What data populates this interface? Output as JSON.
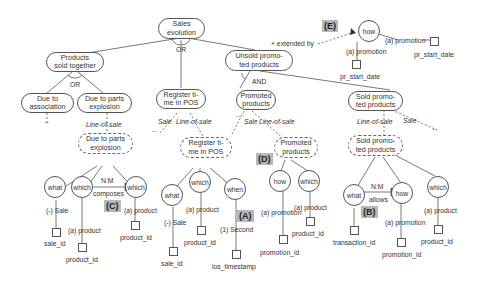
{
  "diagram": {
    "root": {
      "label_1": "Sales",
      "label_2": "evolution"
    },
    "root_decomposition": "OR",
    "goals": {
      "products_sold_together": {
        "label_1": "Products",
        "label_2": "sold together",
        "decomposition": "OR"
      },
      "due_to_association": {
        "label_1": "Due to",
        "label_2": "association"
      },
      "due_to_parts_explosion": {
        "label_1": "Due to parts",
        "label_2": "explosion"
      },
      "register_time_in_pos": {
        "label_1": "Register ti-",
        "label_2": "me in POS"
      },
      "unsold_promoted_products": {
        "label_1": "Unsold promo-",
        "label_2": "ted products",
        "decomposition": "AND"
      },
      "promoted_products": {
        "label_1": "Promoted",
        "label_2": "products"
      },
      "sold_promoted_products": {
        "label_1": "Sold promo-",
        "label_2": "ted products"
      }
    },
    "contexts": {
      "due_to_parts_explosion": {
        "label_1": "Due to parts",
        "label_2": "explosion"
      },
      "register_time_in_pos": {
        "label_1": "Register ti-",
        "label_2": "me in POS"
      },
      "promoted_products": {
        "label_1": "Promoted",
        "label_2": "products"
      },
      "sold_promoted_products": {
        "label_1": "Sold promo-",
        "label_2": "ted products"
      }
    },
    "edge_labels": {
      "line_of_sale": "Line-of-sale",
      "sale": "Sale",
      "extended_by": "+ extended by",
      "ellipsis": "..."
    },
    "dimensions": [
      {
        "id": "d1",
        "label": "what",
        "attr_label": "(-) Sale",
        "attr": "sale_id"
      },
      {
        "id": "d2",
        "label": "which",
        "attr_label": "(a) product",
        "attr": "product_id"
      },
      {
        "id": "d3",
        "label": "which",
        "attr_label": "(a) product",
        "attr": "product_id"
      },
      {
        "id": "d4",
        "label": "what",
        "attr_label": "(-) Sale",
        "attr": "sale_id"
      },
      {
        "id": "d5",
        "label": "which",
        "attr_label": "(a) product",
        "attr": "product_id"
      },
      {
        "id": "d6",
        "label": "when",
        "attr_label": "(1) Second",
        "attr": "los_timestamp"
      },
      {
        "id": "d7",
        "label": "how",
        "attr_label": "(a) promotion",
        "attr": "promotion_id"
      },
      {
        "id": "d8",
        "label": "which",
        "attr_label": "(a) product",
        "attr": "product_id"
      },
      {
        "id": "d9",
        "label": "what",
        "attr_label": "",
        "attr": "transaction_id"
      },
      {
        "id": "d10",
        "label": "how",
        "attr_label": "(a) promotion",
        "attr": "promotion_id"
      },
      {
        "id": "d11",
        "label": "which",
        "attr_label": "(a) product",
        "attr": "product_id"
      },
      {
        "id": "d12",
        "label": "how",
        "attr_label": "(a) promotion",
        "attr": "pr_start_date",
        "attr_label_2": "(a) promotion",
        "attr_2": "pr_start_date"
      }
    ],
    "relations": {
      "composes": {
        "cardinality": "N:M",
        "label": "composes"
      },
      "allows": {
        "cardinality": "N:M",
        "label": "allows"
      }
    },
    "tags": {
      "a": "(A)",
      "b": "(B)",
      "c": "(C)",
      "d": "(D)",
      "e": "(E)"
    },
    "colors": {
      "line": "#555555",
      "tag_bg": "#b8b8b8",
      "text": "#333333"
    }
  }
}
